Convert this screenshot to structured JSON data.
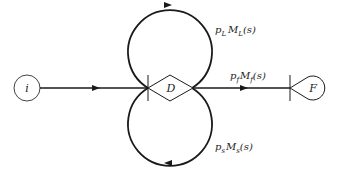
{
  "diagram": {
    "type": "signal-flow-graph",
    "nodes": {
      "start": {
        "label": "i"
      },
      "decision": {
        "label": "D"
      },
      "final": {
        "label": "F"
      }
    },
    "edges": {
      "loop_top": {
        "p": "p",
        "p_sub": "L",
        "m": "M",
        "m_sub": "L",
        "arg": "(s)"
      },
      "forward": {
        "p": "p",
        "p_sub": "f",
        "m": "M",
        "m_sub": "f",
        "arg": "(s)"
      },
      "loop_bottom": {
        "p": "p",
        "p_sub": "s",
        "m": "M",
        "m_sub": "s",
        "arg": "(s)"
      }
    },
    "colors": {
      "stroke": "#1a1a1a",
      "text": "#222222",
      "background": "#ffffff"
    }
  }
}
